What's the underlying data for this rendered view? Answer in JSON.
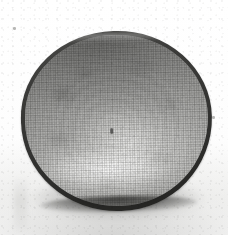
{
  "image": {
    "subject": "ceramic bowl",
    "description": "Overhead photograph of a shallow round ceramic bowl with a dark rim and a mottled pale grey glazed interior, printed as a halftone and scanned.",
    "medium": "halftone print scan",
    "view": "top-down, slightly tilted",
    "canvas": {
      "width": 228,
      "height": 235
    },
    "background": {
      "name": "paper",
      "color": "#fdfdfc",
      "shadow_color": "#b2b2b0"
    },
    "object": {
      "name": "bowl",
      "bounds": {
        "left": 21,
        "top": 31,
        "width": 191,
        "height": 180
      },
      "rim": {
        "name": "rim",
        "color": "#343432",
        "thickness_px": 4
      },
      "interior": {
        "name": "glazed-interior",
        "base_color": "#b0b0ae",
        "highlight_color": "#ffffff",
        "shade_color": "#7e7e7c"
      },
      "marks": [
        {
          "name": "centre-mark",
          "x": 114,
          "y": 131
        }
      ]
    },
    "specks": [
      {
        "name": "speck-top-left",
        "x": 14,
        "y": 28
      },
      {
        "name": "speck-right",
        "x": 213,
        "y": 117
      }
    ]
  }
}
